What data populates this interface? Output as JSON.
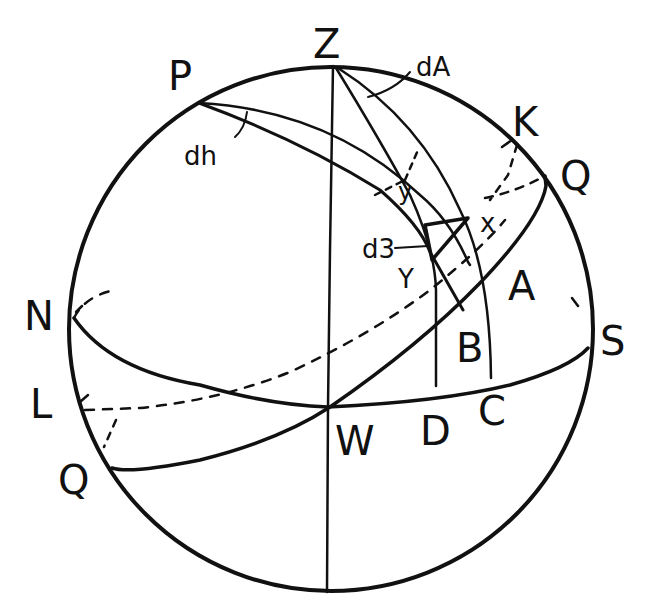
{
  "figure": {
    "type": "celestial-sphere-diagram",
    "background": "#ffffff",
    "ink": "#111111"
  },
  "labels": {
    "zenith": "Z",
    "pole": "P",
    "north": "N",
    "south": "S",
    "west": "W",
    "L": "L",
    "K": "K",
    "Q_right": "Q",
    "Q_left": "Q",
    "A": "A",
    "B": "B",
    "C": "C",
    "D": "D",
    "X": "x",
    "Y": "Y",
    "y": "y",
    "dA": "dA",
    "dh": "dh",
    "dz": "d3"
  }
}
